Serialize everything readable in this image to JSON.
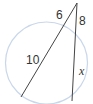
{
  "diagram": {
    "type": "circle-two-secants",
    "colors": {
      "circle": "#c9d7ea",
      "line": "#444444",
      "text": "#333333",
      "background": "#ffffff"
    },
    "circle": {
      "cx": 46.5,
      "cy": 63,
      "r": 41
    },
    "external_point": {
      "x": 77,
      "y": 3
    },
    "secants": [
      {
        "name": "secant-1",
        "from": {
          "x": 77,
          "y": 3
        },
        "to": {
          "x": 21,
          "y": 97
        },
        "external_segment_label": "6",
        "internal_segment_label": "10"
      },
      {
        "name": "secant-2",
        "from": {
          "x": 77,
          "y": 3
        },
        "to": {
          "x": 72,
          "y": 101
        },
        "external_segment_label": "8",
        "internal_segment_label": "x"
      }
    ],
    "labels": {
      "six": "6",
      "ten": "10",
      "eight": "8",
      "x": "x"
    }
  }
}
